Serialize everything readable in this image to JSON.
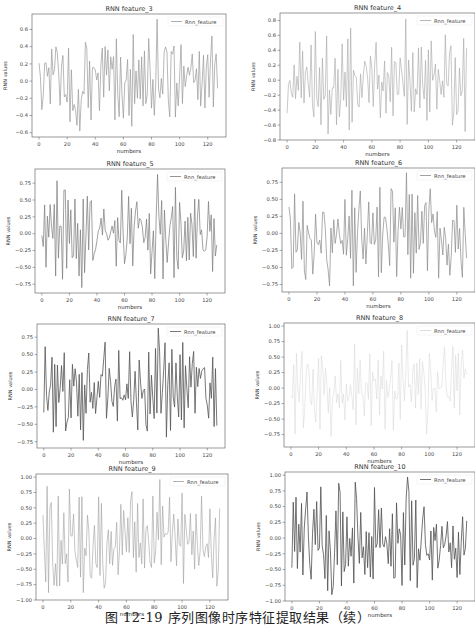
{
  "figure": {
    "caption": "图 12-19    序列图像时序特征提取结果（续）"
  },
  "chart_data": [
    {
      "type": "line",
      "title": "RNN feature_3",
      "xlabel": "numbers",
      "ylabel": "RNN values",
      "legend": "Rnn_feature",
      "legend_position": "upper right",
      "xlim": [
        -5,
        133
      ],
      "ylim": [
        -0.65,
        0.78
      ],
      "xticks": [
        0,
        20,
        40,
        60,
        80,
        100,
        120
      ],
      "yticks": [
        -0.6,
        -0.4,
        -0.2,
        0.0,
        0.2,
        0.4,
        0.6
      ],
      "ytick_labels": [
        "−0.6",
        "−0.4",
        "−0.2",
        "0.0",
        "0.2",
        "0.4",
        "0.6"
      ],
      "line_color": "#9a9a9a",
      "line_width": 0.7,
      "n_points": 128,
      "seed": 3,
      "amp": 0.42,
      "peak_max": 0.72,
      "peak_min": -0.58
    },
    {
      "type": "line",
      "title": "RNN feature_4",
      "xlabel": "numbers",
      "ylabel": "RNN values",
      "legend": "Rnn_feature",
      "legend_position": "upper right",
      "xlim": [
        -5,
        133
      ],
      "ylim": [
        -0.8,
        0.9
      ],
      "xticks": [
        0,
        20,
        40,
        60,
        80,
        100,
        120
      ],
      "yticks": [
        -0.8,
        -0.6,
        -0.4,
        -0.2,
        0.0,
        0.2,
        0.4,
        0.6,
        0.8
      ],
      "ytick_labels": [
        "−0.8",
        "−0.6",
        "−0.4",
        "−0.2",
        "0.0",
        "0.2",
        "0.4",
        "0.6",
        "0.8"
      ],
      "line_color": "#a5a5a5",
      "line_width": 0.6,
      "n_points": 128,
      "seed": 4,
      "amp": 0.5,
      "peak_max": 0.82,
      "peak_min": -0.72
    },
    {
      "type": "line",
      "title": "RNN feature_5",
      "xlabel": "numbers",
      "ylabel": "RNN values",
      "legend": "Rnn_feature",
      "legend_position": "upper right",
      "xlim": [
        -5,
        133
      ],
      "ylim": [
        -0.88,
        0.96
      ],
      "xticks": [
        0,
        20,
        40,
        60,
        80,
        100,
        120
      ],
      "yticks": [
        -0.75,
        -0.5,
        -0.25,
        0.0,
        0.25,
        0.5,
        0.75
      ],
      "ytick_labels": [
        "−0.75",
        "−0.50",
        "−0.25",
        "0.00",
        "0.25",
        "0.50",
        "0.75"
      ],
      "line_color": "#7a7a7a",
      "line_width": 0.7,
      "n_points": 128,
      "seed": 5,
      "amp": 0.55,
      "peak_max": 0.88,
      "peak_min": -0.8
    },
    {
      "type": "line",
      "title": "RNN feature_6",
      "xlabel": "numbers",
      "ylabel": "RNN values",
      "legend": "Rnn_feature",
      "legend_position": "upper right",
      "xlim": [
        -5,
        133
      ],
      "ylim": [
        -0.86,
        0.96
      ],
      "xticks": [
        0,
        20,
        40,
        60,
        80,
        100,
        120
      ],
      "yticks": [
        -0.75,
        -0.5,
        -0.25,
        0.0,
        0.25,
        0.5,
        0.75
      ],
      "ytick_labels": [
        "−0.75",
        "−0.50",
        "−0.25",
        "0.00",
        "0.25",
        "0.50",
        "0.75"
      ],
      "line_color": "#8a8a8a",
      "line_width": 0.7,
      "n_points": 128,
      "seed": 6,
      "amp": 0.55,
      "peak_max": 0.89,
      "peak_min": -0.77
    },
    {
      "type": "line",
      "title": "RNN feature_7",
      "xlabel": "numbers",
      "ylabel": "RNN values",
      "legend": "Rnn_feature",
      "legend_position": "upper right",
      "xlim": [
        -5,
        133
      ],
      "ylim": [
        -0.84,
        0.94
      ],
      "xticks": [
        0,
        20,
        40,
        60,
        80,
        100,
        120
      ],
      "yticks": [
        -0.75,
        -0.5,
        -0.25,
        0.0,
        0.25,
        0.5,
        0.75
      ],
      "ytick_labels": [
        "−0.75",
        "−0.50",
        "−0.25",
        "0.00",
        "0.25",
        "0.50",
        "0.75"
      ],
      "line_color": "#555555",
      "line_width": 0.8,
      "n_points": 128,
      "seed": 7,
      "amp": 0.55,
      "peak_max": 0.88,
      "peak_min": -0.73
    },
    {
      "type": "line",
      "title": "RNN feature_8",
      "xlabel": "numbers",
      "ylabel": "RNN values",
      "legend": "Rnn_feature",
      "legend_position": "upper right",
      "xlim": [
        -5,
        133
      ],
      "ylim": [
        -0.95,
        1.05
      ],
      "xticks": [
        0,
        20,
        40,
        60,
        80,
        100,
        120
      ],
      "yticks": [
        -0.75,
        -0.5,
        -0.25,
        0.0,
        0.25,
        0.5,
        0.75,
        1.0
      ],
      "ytick_labels": [
        "−0.75",
        "−0.50",
        "−0.25",
        "0.00",
        "0.25",
        "0.50",
        "0.75",
        "1.00"
      ],
      "line_color": "#d4d4d4",
      "line_width": 0.5,
      "n_points": 128,
      "seed": 8,
      "amp": 0.6,
      "peak_max": 0.93,
      "peak_min": -0.78
    },
    {
      "type": "line",
      "title": "RNN feature_9",
      "xlabel": "numbers",
      "ylabel": "RNN values",
      "legend": "Rnn_feature",
      "legend_position": "upper right",
      "xlim": [
        -5,
        133
      ],
      "ylim": [
        -1.0,
        1.05
      ],
      "xticks": [
        0,
        20,
        40,
        60,
        80,
        100,
        120
      ],
      "yticks": [
        -1.0,
        -0.75,
        -0.5,
        -0.25,
        0.0,
        0.25,
        0.5,
        0.75,
        1.0
      ],
      "ytick_labels": [
        "−1.00",
        "−0.75",
        "−0.50",
        "−0.25",
        "0.00",
        "0.25",
        "0.50",
        "0.75",
        "1.00"
      ],
      "line_color": "#a0a0a0",
      "line_width": 0.6,
      "n_points": 128,
      "seed": 9,
      "amp": 0.65,
      "peak_max": 0.96,
      "peak_min": -0.88
    },
    {
      "type": "line",
      "title": "RNN feature_10",
      "xlabel": "numbers",
      "ylabel": "RNN values",
      "legend": "Rnn_feature",
      "legend_position": "upper right",
      "xlim": [
        -5,
        133
      ],
      "ylim": [
        -1.0,
        1.05
      ],
      "xticks": [
        0,
        20,
        40,
        60,
        80,
        100,
        120
      ],
      "yticks": [
        -1.0,
        -0.75,
        -0.5,
        -0.25,
        0.0,
        0.25,
        0.5,
        0.75,
        1.0
      ],
      "ytick_labels": [
        "−1.00",
        "−0.75",
        "−0.50",
        "−0.25",
        "0.00",
        "0.25",
        "0.50",
        "0.75",
        "1.00"
      ],
      "line_color": "#505050",
      "line_width": 0.8,
      "n_points": 128,
      "seed": 10,
      "amp": 0.7,
      "peak_max": 0.97,
      "peak_min": -0.9
    }
  ],
  "layout": {
    "panels": [
      {
        "left": 0,
        "top": 0,
        "width": 238,
        "height": 155,
        "ax": {
          "x": 32,
          "y": 14,
          "w": 194,
          "h": 123
        }
      },
      {
        "left": 237,
        "top": 0,
        "width": 238,
        "height": 155,
        "ax": {
          "x": 43,
          "y": 13,
          "w": 195,
          "h": 127
        }
      },
      {
        "left": 0,
        "top": 155,
        "width": 238,
        "height": 155,
        "ax": {
          "x": 35,
          "y": 14,
          "w": 190,
          "h": 124
        }
      },
      {
        "left": 237,
        "top": 155,
        "width": 238,
        "height": 155,
        "ax": {
          "x": 45,
          "y": 13,
          "w": 193,
          "h": 124
        }
      },
      {
        "left": 0,
        "top": 310,
        "width": 238,
        "height": 155,
        "ax": {
          "x": 37,
          "y": 14,
          "w": 188,
          "h": 124
        }
      },
      {
        "left": 237,
        "top": 310,
        "width": 238,
        "height": 155,
        "ax": {
          "x": 47,
          "y": 13,
          "w": 191,
          "h": 124
        }
      },
      {
        "left": 0,
        "top": 465,
        "width": 238,
        "height": 142,
        "ax": {
          "x": 36,
          "y": 9,
          "w": 192,
          "h": 126
        }
      },
      {
        "left": 237,
        "top": 465,
        "width": 238,
        "height": 142,
        "ax": {
          "x": 48,
          "y": 7,
          "w": 190,
          "h": 129
        }
      }
    ]
  }
}
